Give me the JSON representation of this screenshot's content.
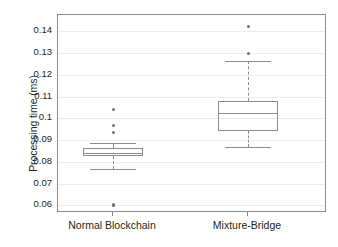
{
  "chart_data": {
    "type": "box",
    "title": "",
    "xlabel": "",
    "ylabel": "Processing time (ms)",
    "categories": [
      "Normal Blockchain",
      "Mixture-Bridge"
    ],
    "ylim": [
      0.0565,
      0.1475
    ],
    "yticks": [
      0.06,
      0.07,
      0.08,
      0.09,
      0.1,
      0.11,
      0.12,
      0.13,
      0.14
    ],
    "ytick_labels": [
      "0.06",
      "0.07",
      "0.08",
      "0.09",
      "0.1",
      "0.11",
      "0.12",
      "0.13",
      "0.14"
    ],
    "grid": true,
    "legend": "none",
    "series": [
      {
        "name": "Normal Blockchain",
        "min_whisker": 0.0765,
        "q1": 0.0825,
        "median": 0.084,
        "q3": 0.0862,
        "max_whisker": 0.0888,
        "outliers": [
          0.1042,
          0.0968,
          0.0936,
          0.0603,
          0.0598
        ]
      },
      {
        "name": "Mixture-Bridge",
        "min_whisker": 0.0868,
        "q1": 0.094,
        "median": 0.1025,
        "q3": 0.108,
        "max_whisker": 0.1262,
        "outliers": [
          0.1423,
          0.1297
        ]
      }
    ],
    "colors": {
      "line": "#8c8c8c",
      "grid": "#ececec",
      "outlier": "#6f6f6f",
      "text": "#231f20",
      "background": "#ffffff"
    }
  }
}
